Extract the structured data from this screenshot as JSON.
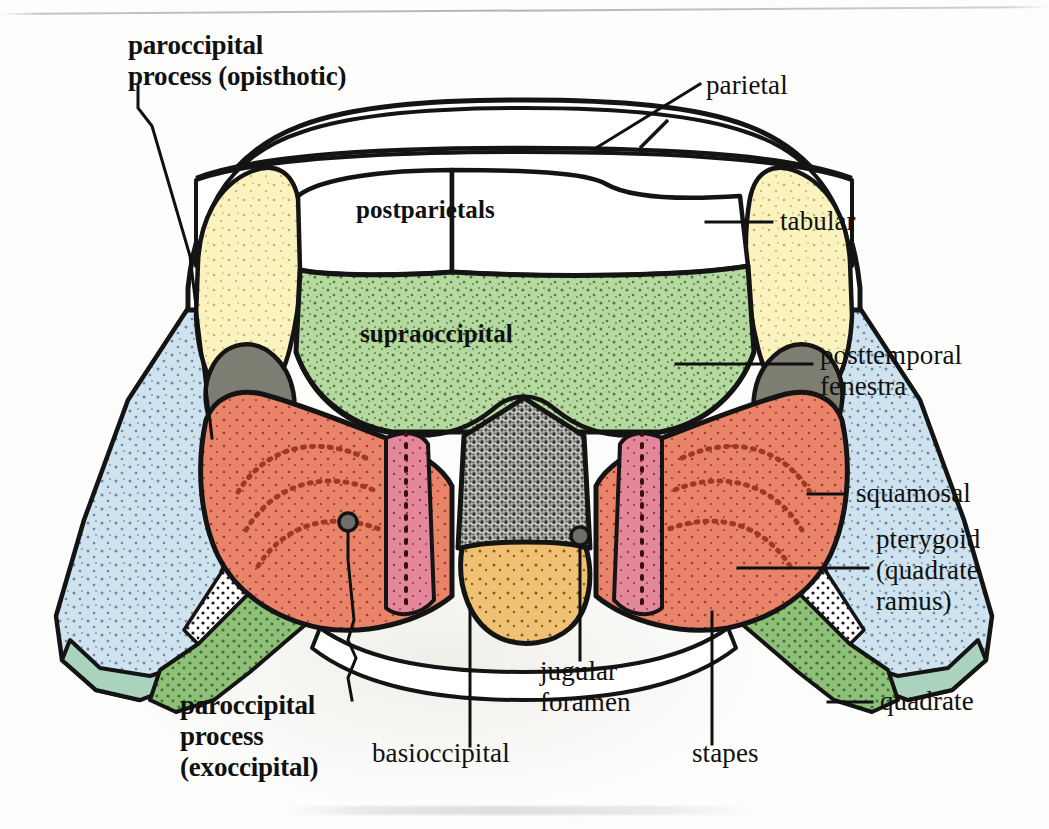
{
  "figure": {
    "kind": "anatomical-diagram",
    "view": "posterior / occipital",
    "background_color": "#fdfdfc",
    "page_rule_color": "#b0b0b0"
  },
  "labels": {
    "paroccipital_opisthotic": "paroccipital\nprocess (opisthotic)",
    "parietal": "parietal",
    "tabular": "tabular",
    "posttemporal_fenestra": "posttemporal\nfenestra",
    "squamosal": "squamosal",
    "pterygoid": "pterygoid\n(quadrate\nramus)",
    "quadrate": "quadrate",
    "postparietals": "postparietals",
    "supraoccipital": "supraoccipital",
    "paroccipital_exoccipital": "paroccipital\nprocess\n(exoccipital)",
    "basioccipital": "basioccipital",
    "jugular_foramen": "jugular\nforamen",
    "stapes": "stapes"
  },
  "structures": [
    {
      "name": "parietal",
      "fill": "#ffffff",
      "label_side": "right",
      "bold": false
    },
    {
      "name": "postparietals",
      "fill": "#ffffff",
      "label_side": "inner",
      "bold": true
    },
    {
      "name": "tabular",
      "fill": "#faf3c0",
      "label_side": "right",
      "bold": false
    },
    {
      "name": "supraoccipital",
      "fill": "#b5d9a0",
      "label_side": "inner",
      "bold": true
    },
    {
      "name": "posttemporal-fenestra",
      "fill": "#7d7d72",
      "label_side": "right",
      "bold": false
    },
    {
      "name": "squamosal",
      "fill": "#cfe3ee",
      "label_side": "right",
      "bold": false
    },
    {
      "name": "pterygoid",
      "fill": "#cfe3ee",
      "label_side": "right",
      "bold": false
    },
    {
      "name": "quadrate",
      "fill": "#a9d3bc",
      "label_side": "right",
      "bold": false
    },
    {
      "name": "paroccipital-process",
      "fill": "#e8846a",
      "label_side": "left",
      "bold": true
    },
    {
      "name": "exoccipital-column",
      "fill": "#e3889a",
      "label_side": "left",
      "bold": true
    },
    {
      "name": "foramen-magnum",
      "fill": "#8f8f8a",
      "label_side": "none",
      "bold": false
    },
    {
      "name": "basioccipital",
      "fill": "#f0c173",
      "label_side": "bottom",
      "bold": false
    },
    {
      "name": "stapes",
      "fill": "#8ec07a",
      "label_side": "bottom",
      "bold": false
    },
    {
      "name": "jugular-foramen",
      "fill": "#6f6f6a",
      "label_side": "bottom",
      "bold": false
    }
  ],
  "colors": {
    "outline": "#141414",
    "tabular_yellow": "#faf3c0",
    "supraoccipital_green": "#b5d9a0",
    "fenestra_gray": "#7d7d72",
    "squamosal_blue": "#cfe3ee",
    "paroccipital_salmon": "#e8846a",
    "exoccipital_pink": "#e3889a",
    "basioccipital_orange": "#f0c173",
    "stapes_green": "#8ec07a",
    "quadrate_green": "#a9d3bc",
    "foramen_gray": "#8f8f8a"
  }
}
